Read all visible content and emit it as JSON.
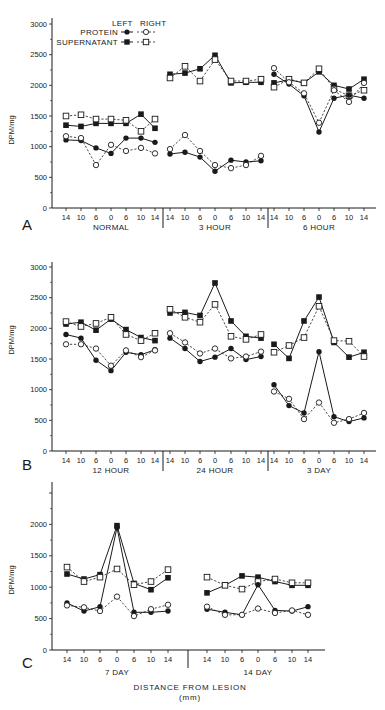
{
  "chart_data": [
    {
      "panel": "A",
      "type": "line",
      "ylabel": "DPM/mg",
      "ylim": [
        0,
        3000
      ],
      "yticks": [
        0,
        500,
        1000,
        1500,
        2000,
        2500,
        3000
      ],
      "x_tick_labels": [
        "14",
        "10",
        "6",
        "0",
        "6",
        "10",
        "14"
      ],
      "groups": [
        "NORMAL",
        "3 HOUR",
        "6 HOUR"
      ],
      "legend": {
        "header": [
          "LEFT",
          "RIGHT"
        ],
        "entries": [
          "PROTEIN",
          "SUPERNATANT"
        ]
      },
      "series": [
        {
          "name": "Supernatant Left",
          "marker": "filled-square",
          "line": "solid",
          "groups": [
            [
              1350,
              1330,
              1380,
              1380,
              1380,
              1530,
              1300
            ],
            [
              2180,
              2200,
              2270,
              2490,
              2040,
              2050,
              2050
            ],
            [
              2040,
              2090,
              2040,
              2220,
              2000,
              1940,
              2100
            ]
          ]
        },
        {
          "name": "Supernatant Right",
          "marker": "open-square",
          "line": "dashed",
          "groups": [
            [
              1500,
              1520,
              1450,
              1450,
              1430,
              1250,
              1450
            ],
            [
              2120,
              2310,
              2070,
              2420,
              2070,
              2070,
              2100
            ],
            [
              1970,
              2100,
              2040,
              2270,
              1940,
              1830,
              1920
            ]
          ]
        },
        {
          "name": "Protein Left",
          "marker": "filled-circle",
          "line": "solid",
          "groups": [
            [
              1110,
              1100,
              980,
              890,
              1140,
              1140,
              1070
            ],
            [
              880,
              910,
              830,
              600,
              780,
              750,
              770
            ],
            [
              2180,
              2020,
              1830,
              1240,
              1790,
              1840,
              1790
            ]
          ]
        },
        {
          "name": "Protein Right",
          "marker": "open-circle",
          "line": "dashed",
          "groups": [
            [
              1170,
              1140,
              700,
              1030,
              930,
              980,
              890
            ],
            [
              960,
              1190,
              930,
              700,
              650,
              700,
              850
            ],
            [
              2280,
              2050,
              1870,
              1390,
              1920,
              1730,
              2040
            ]
          ]
        }
      ]
    },
    {
      "panel": "B",
      "type": "line",
      "ylabel": "DPM/mg",
      "ylim": [
        0,
        3000
      ],
      "yticks": [
        0,
        500,
        1000,
        1500,
        2000,
        2500,
        3000
      ],
      "x_tick_labels": [
        "14",
        "10",
        "6",
        "0",
        "6",
        "10",
        "14"
      ],
      "groups": [
        "12 HOUR",
        "24 HOUR",
        "3 DAY"
      ],
      "series": [
        {
          "name": "Supernatant Left",
          "marker": "filled-square",
          "line": "solid",
          "groups": [
            [
              2070,
              2100,
              1970,
              2150,
              1980,
              1850,
              1800
            ],
            [
              2250,
              2260,
              2210,
              2740,
              2120,
              1870,
              1840
            ],
            [
              1740,
              1510,
              2120,
              2510,
              1770,
              1530,
              1610
            ]
          ]
        },
        {
          "name": "Supernatant Right",
          "marker": "open-square",
          "line": "dashed",
          "groups": [
            [
              2110,
              2030,
              2080,
              2180,
              1900,
              1800,
              1920
            ],
            [
              2310,
              2180,
              2100,
              2390,
              1870,
              1820,
              1900
            ],
            [
              1610,
              1720,
              1850,
              2360,
              1800,
              1790,
              1540
            ]
          ]
        },
        {
          "name": "Protein Left",
          "marker": "filled-circle",
          "line": "solid",
          "groups": [
            [
              1900,
              1840,
              1480,
              1310,
              1610,
              1570,
              1650
            ],
            [
              1840,
              1670,
              1460,
              1530,
              1670,
              1490,
              1540
            ],
            [
              1080,
              740,
              620,
              1620,
              560,
              480,
              540
            ]
          ]
        },
        {
          "name": "Protein Right",
          "marker": "open-circle",
          "line": "dashed",
          "groups": [
            [
              1740,
              1740,
              1670,
              1390,
              1640,
              1530,
              1640
            ],
            [
              1920,
              1770,
              1590,
              1670,
              1510,
              1540,
              1620
            ],
            [
              970,
              850,
              520,
              790,
              460,
              520,
              620
            ]
          ]
        }
      ]
    },
    {
      "panel": "C",
      "type": "line",
      "ylabel": "DPM/mg",
      "ylim": [
        0,
        2500
      ],
      "yticks": [
        0,
        500,
        1000,
        1500,
        2000,
        2500
      ],
      "ytick_labels": [
        "0",
        "500",
        "1000",
        "1500",
        "2000",
        ""
      ],
      "x_tick_labels": [
        "14",
        "10",
        "6",
        "0",
        "6",
        "10",
        "14"
      ],
      "groups": [
        "7 DAY",
        "14 DAY"
      ],
      "xlabel": "DISTANCE FROM LESION",
      "xlabel_unit": "(mm)",
      "series": [
        {
          "name": "Supernatant Left",
          "marker": "filled-square",
          "line": "solid",
          "groups": [
            [
              1210,
              1130,
              1200,
              1980,
              1060,
              960,
              1150
            ],
            [
              910,
              1030,
              1180,
              1160,
              1090,
              1030,
              1030
            ]
          ]
        },
        {
          "name": "Supernatant Right",
          "marker": "open-square",
          "line": "dashed",
          "groups": [
            [
              1320,
              1090,
              1160,
              1290,
              1040,
              1090,
              1280
            ],
            [
              1160,
              1030,
              970,
              1090,
              1130,
              1070,
              1070
            ]
          ]
        },
        {
          "name": "Protein Left",
          "marker": "filled-circle",
          "line": "solid",
          "groups": [
            [
              750,
              620,
              690,
              1950,
              600,
              600,
              620
            ],
            [
              650,
              600,
              560,
              1040,
              630,
              620,
              690
            ]
          ]
        },
        {
          "name": "Protein Right",
          "marker": "open-circle",
          "line": "dashed",
          "groups": [
            [
              710,
              680,
              620,
              850,
              540,
              650,
              720
            ],
            [
              690,
              560,
              560,
              660,
              590,
              630,
              560
            ]
          ]
        }
      ]
    }
  ],
  "layout": {
    "panels": [
      {
        "axis_x": 52,
        "axis_y_top": 18,
        "y0": 208,
        "y_top_val_px": 24,
        "x_end": 376,
        "group_x": [
          [
            66,
            81,
            96,
            111,
            126,
            141,
            155
          ],
          [
            170,
            185,
            200,
            215,
            231,
            246,
            261
          ],
          [
            274,
            289,
            304,
            319,
            334,
            349,
            364
          ]
        ],
        "dividers": [
          163,
          268
        ],
        "letter_xy": [
          22,
          230
        ],
        "ylabel_xy": [
          14,
          130
        ]
      },
      {
        "axis_x": 52,
        "axis_y_top": 262,
        "y0": 451,
        "y_top_val_px": 267,
        "x_end": 376,
        "group_x": [
          [
            66,
            81,
            96,
            111,
            126,
            141,
            155
          ],
          [
            170,
            185,
            200,
            215,
            231,
            246,
            261
          ],
          [
            274,
            289,
            304,
            319,
            334,
            349,
            364
          ]
        ],
        "dividers": [
          163,
          268
        ],
        "letter_xy": [
          22,
          470
        ],
        "ylabel_xy": [
          14,
          340
        ]
      },
      {
        "axis_x": 52,
        "axis_y_top": 482,
        "y0": 650,
        "y_top_val_px": 493,
        "x_end": 325,
        "group_x": [
          [
            67,
            84,
            100,
            117,
            134,
            151,
            168
          ],
          [
            207,
            225,
            242,
            258,
            275,
            292,
            308
          ]
        ],
        "dividers": [
          188
        ],
        "letter_xy": [
          22,
          668
        ],
        "ylabel_xy": [
          14,
          580
        ]
      }
    ],
    "colors": {
      "ink": "#1a1a1a",
      "background": "#ffffff"
    }
  }
}
